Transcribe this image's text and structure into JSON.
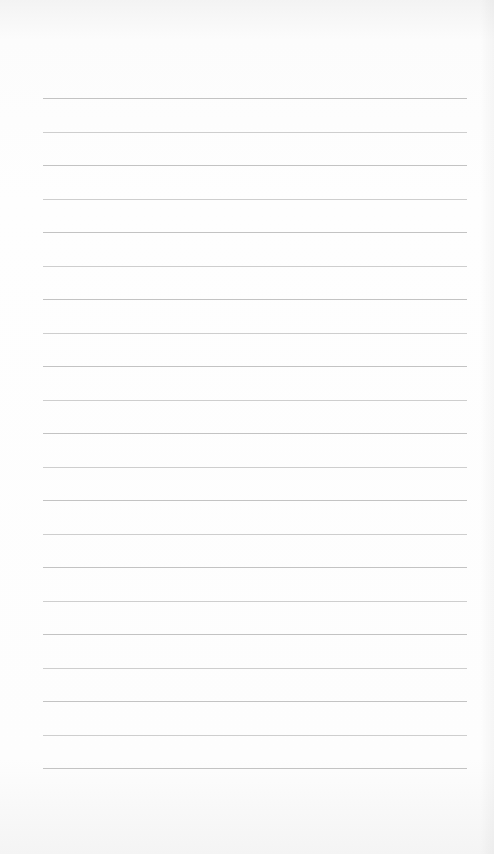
{
  "page": {
    "type": "ruled-notepad",
    "background_color": "#fdfdfd",
    "rule_color": "#b9b9b9",
    "rule_count": 21,
    "rules": [
      {
        "y": 98
      },
      {
        "y": 132
      },
      {
        "y": 165
      },
      {
        "y": 199
      },
      {
        "y": 232
      },
      {
        "y": 266
      },
      {
        "y": 299
      },
      {
        "y": 333
      },
      {
        "y": 366
      },
      {
        "y": 400
      },
      {
        "y": 433
      },
      {
        "y": 467
      },
      {
        "y": 500
      },
      {
        "y": 534
      },
      {
        "y": 567
      },
      {
        "y": 601
      },
      {
        "y": 634
      },
      {
        "y": 668
      },
      {
        "y": 701
      },
      {
        "y": 735
      },
      {
        "y": 768
      }
    ]
  }
}
